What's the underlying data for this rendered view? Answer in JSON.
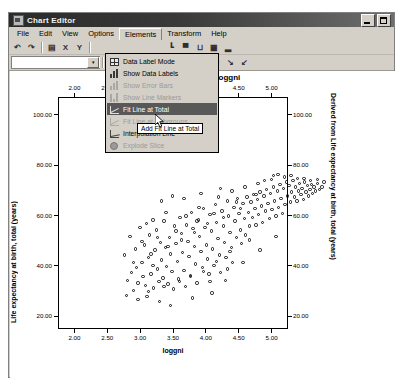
{
  "window": {
    "title": "Chart Editor",
    "icon": "chart-window-icon",
    "buttons": [
      {
        "name": "minimize-button",
        "glyph": "minimize"
      },
      {
        "name": "maximize-button",
        "glyph": "maximize"
      }
    ]
  },
  "menubar": {
    "items": [
      {
        "label": "File",
        "open": false
      },
      {
        "label": "Edit",
        "open": false
      },
      {
        "label": "View",
        "open": false
      },
      {
        "label": "Options",
        "open": false
      },
      {
        "label": "Elements",
        "open": true
      },
      {
        "label": "Transform",
        "open": false
      },
      {
        "label": "Help",
        "open": false
      }
    ]
  },
  "toolbar1": {
    "items": [
      {
        "name": "undo-icon",
        "glyph": "↶"
      },
      {
        "name": "redo-icon",
        "glyph": "↷"
      },
      {
        "name": "sep1",
        "glyph": "|"
      },
      {
        "name": "properties-icon",
        "glyph": "▤"
      },
      {
        "name": "x-axis-icon",
        "glyph": "X"
      },
      {
        "name": "y-axis-icon",
        "glyph": "Y"
      },
      {
        "name": "sep2",
        "glyph": "|"
      },
      {
        "name": "axis-baseline-icon",
        "glyph": "┗"
      },
      {
        "name": "bar-chart-icon",
        "glyph": "▀"
      },
      {
        "name": "brackets-icon",
        "glyph": "⊔"
      },
      {
        "name": "grid-table-icon",
        "glyph": "▦"
      },
      {
        "name": "histogram-icon",
        "glyph": "▂"
      }
    ]
  },
  "toolbar2": {
    "combo_value": "",
    "combo_placeholder": "",
    "items": [
      {
        "name": "text-format-icon",
        "glyph": "A"
      },
      {
        "name": "fill-color-icon",
        "glyph": "■"
      },
      {
        "name": "line-style-icon",
        "glyph": "—"
      },
      {
        "name": "grid-icon",
        "glyph": "▦"
      },
      {
        "name": "bar-icon",
        "glyph": "▃"
      },
      {
        "name": "bar2-icon",
        "glyph": "▄"
      },
      {
        "name": "line-marker-icon",
        "glyph": "⌇"
      },
      {
        "name": "fitline-icon",
        "glyph": "↗"
      },
      {
        "name": "fitline2-icon",
        "glyph": "↘"
      },
      {
        "name": "interp-icon",
        "glyph": "↙"
      }
    ]
  },
  "dropdown": {
    "name": "elements-menu",
    "items": [
      {
        "label": "Data Label Mode",
        "icon": "grid-ico",
        "state": "normal"
      },
      {
        "label": "Show Data Labels",
        "icon": "bars-ico",
        "state": "normal"
      },
      {
        "label": "Show Error Bars",
        "icon": "bars-ico",
        "state": "disabled"
      },
      {
        "label": "Show Line Markers",
        "icon": "marker-ico",
        "state": "disabled"
      },
      {
        "label": "Fit Line at Total",
        "icon": "fit-ico",
        "state": "selected"
      },
      {
        "label": "Fit Line at Subgroups",
        "icon": "fit-ico",
        "state": "disabled"
      },
      {
        "label": "Interpolation Line",
        "icon": "interp-ico",
        "state": "normal"
      },
      {
        "label": "Explode Slice",
        "icon": "pie-ico",
        "state": "disabled"
      }
    ]
  },
  "tooltip": {
    "text": "Add Fit Line at Total"
  },
  "chart_data": {
    "type": "scatter",
    "title": "Derived from loggni",
    "xlabel": "loggni",
    "ylabel": "Life expectancy at birth, total (years)",
    "y2label": "Derived from Life expectancy at birth, total (years)",
    "xlim": [
      1.75,
      5.25
    ],
    "ylim": [
      15.0,
      107.0
    ],
    "xticks": [
      "2.00",
      "2.50",
      "3.00",
      "3.50",
      "4.00",
      "4.50",
      "5.00"
    ],
    "xtick_values": [
      2.0,
      2.5,
      3.0,
      3.5,
      4.0,
      4.5,
      5.0
    ],
    "yticks": [
      "100.00",
      "80.00",
      "60.00",
      "40.00",
      "20.00"
    ],
    "ytick_values": [
      100,
      80,
      60,
      40,
      20
    ],
    "y2ticks": [
      "100.00",
      "80.00",
      "60.00",
      "40.00",
      "20.00"
    ],
    "top_axis": true,
    "right_axis": true,
    "grid": false,
    "legend": "none",
    "marker": "open-circle",
    "marker_color": "#111111",
    "points": [
      [
        2.02,
        55.0
      ],
      [
        2.06,
        45.0
      ],
      [
        2.1,
        62.5
      ],
      [
        2.12,
        48.0
      ],
      [
        2.15,
        41.0
      ],
      [
        2.18,
        57.5
      ],
      [
        2.2,
        50.0
      ],
      [
        2.22,
        44.0
      ],
      [
        2.25,
        66.0
      ],
      [
        2.28,
        52.0
      ],
      [
        2.3,
        46.5
      ],
      [
        2.32,
        59.0
      ],
      [
        2.34,
        43.0
      ],
      [
        2.36,
        38.5
      ],
      [
        2.38,
        54.0
      ],
      [
        2.4,
        63.0
      ],
      [
        2.42,
        47.5
      ],
      [
        2.45,
        51.0
      ],
      [
        2.46,
        42.0
      ],
      [
        2.48,
        57.0
      ],
      [
        2.5,
        65.0
      ],
      [
        2.52,
        49.5
      ],
      [
        2.54,
        44.5
      ],
      [
        2.56,
        60.0
      ],
      [
        2.58,
        53.0
      ],
      [
        2.6,
        46.0
      ],
      [
        2.62,
        68.5
      ],
      [
        2.64,
        58.0
      ],
      [
        2.66,
        50.5
      ],
      [
        2.68,
        43.5
      ],
      [
        2.7,
        62.0
      ],
      [
        2.72,
        55.5
      ],
      [
        2.74,
        48.5
      ],
      [
        2.76,
        41.5
      ],
      [
        2.78,
        66.5
      ],
      [
        2.8,
        59.5
      ],
      [
        2.82,
        52.5
      ],
      [
        2.84,
        45.5
      ],
      [
        2.86,
        70.0
      ],
      [
        2.88,
        63.5
      ],
      [
        2.9,
        56.0
      ],
      [
        2.92,
        49.0
      ],
      [
        2.94,
        42.5
      ],
      [
        2.96,
        67.0
      ],
      [
        2.98,
        60.5
      ],
      [
        3.0,
        54.5
      ],
      [
        3.02,
        47.0
      ],
      [
        3.04,
        72.0
      ],
      [
        3.06,
        65.5
      ],
      [
        3.08,
        58.5
      ],
      [
        3.1,
        51.5
      ],
      [
        3.12,
        44.0
      ],
      [
        3.14,
        69.0
      ],
      [
        3.16,
        62.5
      ],
      [
        3.18,
        56.5
      ],
      [
        3.2,
        50.0
      ],
      [
        3.22,
        73.5
      ],
      [
        3.24,
        66.0
      ],
      [
        3.26,
        59.0
      ],
      [
        3.28,
        53.5
      ],
      [
        3.3,
        47.5
      ],
      [
        3.32,
        71.0
      ],
      [
        3.34,
        64.5
      ],
      [
        3.36,
        57.5
      ],
      [
        3.38,
        51.0
      ],
      [
        3.4,
        75.0
      ],
      [
        3.42,
        68.0
      ],
      [
        3.44,
        61.5
      ],
      [
        3.46,
        55.0
      ],
      [
        3.48,
        48.0
      ],
      [
        3.5,
        72.5
      ],
      [
        3.52,
        66.5
      ],
      [
        3.54,
        60.0
      ],
      [
        3.56,
        54.0
      ],
      [
        3.58,
        76.5
      ],
      [
        3.6,
        70.5
      ],
      [
        3.62,
        64.0
      ],
      [
        3.64,
        58.0
      ],
      [
        3.66,
        52.0
      ],
      [
        3.68,
        74.0
      ],
      [
        3.7,
        68.5
      ],
      [
        3.72,
        62.0
      ],
      [
        3.74,
        77.5
      ],
      [
        3.76,
        71.5
      ],
      [
        3.78,
        65.0
      ],
      [
        3.8,
        59.5
      ],
      [
        3.82,
        75.5
      ],
      [
        3.84,
        69.5
      ],
      [
        3.86,
        63.0
      ],
      [
        3.88,
        78.0
      ],
      [
        3.9,
        72.0
      ],
      [
        3.92,
        66.5
      ],
      [
        3.94,
        76.0
      ],
      [
        3.96,
        70.0
      ],
      [
        3.98,
        79.0
      ],
      [
        4.0,
        73.5
      ],
      [
        4.02,
        67.0
      ],
      [
        4.04,
        77.0
      ],
      [
        4.06,
        71.0
      ],
      [
        4.08,
        80.0
      ],
      [
        4.1,
        74.5
      ],
      [
        4.12,
        68.0
      ],
      [
        4.14,
        78.5
      ],
      [
        4.16,
        72.5
      ],
      [
        4.18,
        81.0
      ],
      [
        4.2,
        75.5
      ],
      [
        4.22,
        69.5
      ],
      [
        4.24,
        79.5
      ],
      [
        4.26,
        73.0
      ],
      [
        4.28,
        82.0
      ],
      [
        4.3,
        76.5
      ],
      [
        4.32,
        70.5
      ],
      [
        4.34,
        80.5
      ],
      [
        4.36,
        74.0
      ],
      [
        4.38,
        83.0
      ],
      [
        4.4,
        77.5
      ],
      [
        4.42,
        71.5
      ],
      [
        4.44,
        81.5
      ],
      [
        4.46,
        75.0
      ],
      [
        4.48,
        84.0
      ],
      [
        4.5,
        78.5
      ],
      [
        4.52,
        82.5
      ],
      [
        4.54,
        76.0
      ],
      [
        4.56,
        80.0
      ],
      [
        4.58,
        84.5
      ],
      [
        4.6,
        78.0
      ],
      [
        4.62,
        82.0
      ],
      [
        4.64,
        76.5
      ],
      [
        4.66,
        80.5
      ],
      [
        4.68,
        83.5
      ],
      [
        4.7,
        79.0
      ],
      [
        4.72,
        81.5
      ],
      [
        4.74,
        77.0
      ],
      [
        4.76,
        84.0
      ],
      [
        4.78,
        80.0
      ],
      [
        4.8,
        82.5
      ],
      [
        4.82,
        78.5
      ],
      [
        4.84,
        81.0
      ],
      [
        4.86,
        83.0
      ],
      [
        4.88,
        79.5
      ],
      [
        4.9,
        82.0
      ],
      [
        4.92,
        80.5
      ],
      [
        4.95,
        83.5
      ],
      [
        4.98,
        81.0
      ],
      [
        5.02,
        82.0
      ],
      [
        2.55,
        36.5
      ],
      [
        2.72,
        35.0
      ],
      [
        3.05,
        38.0
      ],
      [
        3.35,
        40.0
      ],
      [
        3.55,
        45.0
      ],
      [
        2.95,
        70.5
      ],
      [
        3.15,
        74.0
      ],
      [
        2.45,
        69.0
      ],
      [
        2.35,
        67.5
      ],
      [
        2.65,
        72.0
      ],
      [
        3.45,
        78.0
      ],
      [
        3.65,
        80.5
      ],
      [
        3.85,
        82.0
      ],
      [
        4.05,
        83.5
      ],
      [
        4.25,
        85.0
      ],
      [
        4.45,
        86.0
      ],
      [
        4.65,
        85.5
      ],
      [
        4.85,
        84.5
      ],
      [
        2.28,
        60.5
      ],
      [
        2.52,
        62.0
      ],
      [
        2.8,
        64.5
      ],
      [
        3.12,
        68.5
      ],
      [
        3.38,
        71.5
      ],
      [
        3.72,
        76.0
      ],
      [
        4.15,
        84.5
      ],
      [
        2.15,
        52.0
      ],
      [
        2.42,
        55.5
      ],
      [
        2.68,
        58.5
      ],
      [
        2.88,
        61.0
      ],
      [
        3.08,
        64.0
      ],
      [
        3.28,
        67.5
      ],
      [
        3.52,
        70.0
      ],
      [
        3.78,
        73.5
      ],
      [
        4.02,
        79.0
      ],
      [
        4.28,
        86.5
      ],
      [
        2.05,
        39.0
      ],
      [
        2.22,
        37.5
      ],
      [
        2.38,
        40.5
      ],
      [
        2.62,
        42.5
      ],
      [
        2.85,
        44.5
      ],
      [
        3.02,
        46.5
      ],
      [
        3.22,
        48.5
      ],
      [
        3.42,
        52.5
      ],
      [
        3.62,
        56.5
      ],
      [
        3.92,
        61.0
      ],
      [
        4.35,
        87.0
      ],
      [
        4.55,
        86.5
      ],
      [
        4.75,
        85.5
      ],
      [
        4.95,
        85.0
      ],
      [
        5.05,
        84.0
      ],
      [
        2.75,
        78.5
      ],
      [
        2.58,
        76.5
      ],
      [
        3.18,
        79.5
      ],
      [
        3.48,
        81.5
      ],
      [
        2.92,
        77.5
      ],
      [
        3.58,
        49.5
      ],
      [
        3.82,
        52.0
      ],
      [
        4.08,
        57.0
      ],
      [
        4.32,
        62.5
      ],
      [
        3.32,
        44.5
      ]
    ]
  }
}
